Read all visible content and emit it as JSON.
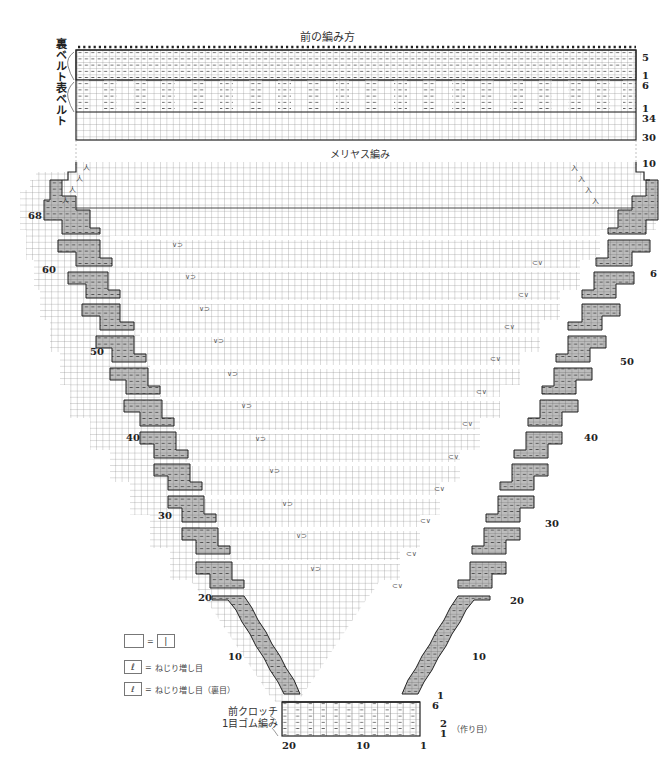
{
  "header": {
    "title": "前の編み方"
  },
  "belt_section": {
    "back_belt_label": "裏ベルト",
    "front_belt_label": "表ベルト",
    "right_row_labels": [
      "5",
      "1",
      "6",
      "1",
      "34",
      "30"
    ]
  },
  "body_section": {
    "title": "メリヤス編み",
    "left_row_labels": [
      "68",
      "60",
      "50",
      "40",
      "30",
      "20",
      "10"
    ],
    "right_row_labels": [
      "10",
      "6",
      "50",
      "40",
      "30",
      "20",
      "10",
      "1",
      "6"
    ],
    "decrease_symbols": [
      "入",
      "人"
    ],
    "increase_symbol": "ℓ",
    "center_marks": {
      "left": "∨⊃",
      "right": "⊂∨"
    }
  },
  "crotch_section": {
    "title_line1": "前クロッチ",
    "title_line2": "1目ゴム編み",
    "bottom_labels": {
      "left": "20",
      "middle": "10",
      "right": "1"
    },
    "cast_on_rows": [
      "2",
      "1"
    ],
    "cast_on_label": "（作り目）"
  },
  "legend": {
    "items": [
      {
        "symbol": "",
        "equals": "=",
        "result": "|",
        "text": ""
      },
      {
        "symbol": "ℓ",
        "equals": "=",
        "text": "ねじり増し目"
      },
      {
        "symbol": "ℓ",
        "equals": "=",
        "text": "ねじり増し目（裏目）"
      }
    ]
  },
  "colors": {
    "grid_line": "#888888",
    "heavy_line": "#222222",
    "shaded_cell": "#bdbdbd",
    "background": "#ffffff"
  }
}
